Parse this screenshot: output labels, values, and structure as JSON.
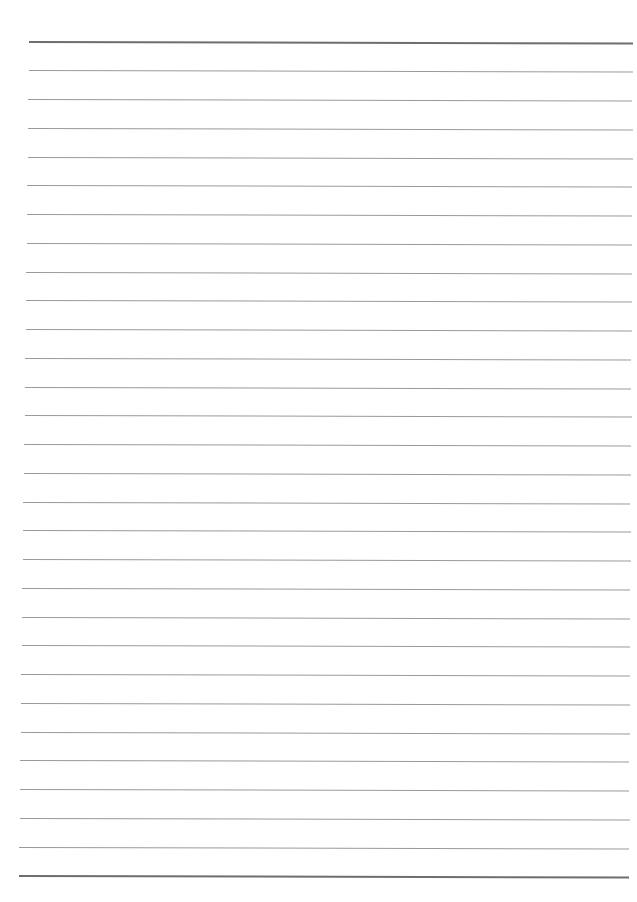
{
  "page": {
    "type": "lined-paper",
    "line_count": 30,
    "first_line_y": 42,
    "last_line_y": 876,
    "top_left_x": 29,
    "top_right_x": 633,
    "bottom_left_x": 19,
    "bottom_right_x": 629,
    "skew_deg": 0.15,
    "line_color": "#9a9a9a",
    "border_line_color": "#6e6e6e",
    "background_color": "#ffffff"
  }
}
